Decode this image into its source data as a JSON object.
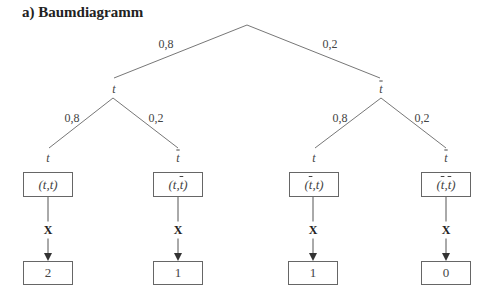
{
  "title": "a)  Baumdiagramm",
  "tree": {
    "level1": [
      {
        "label": "t",
        "bar": false,
        "prob": "0,8"
      },
      {
        "label": "t",
        "bar": true,
        "prob": "0,2"
      }
    ],
    "level2": [
      {
        "label": "t",
        "bar": false,
        "prob": "0,8"
      },
      {
        "label": "t",
        "bar": true,
        "prob": "0,2"
      },
      {
        "label": "t",
        "bar": false,
        "prob": "0,8"
      },
      {
        "label": "t",
        "bar": true,
        "prob": "0,2"
      }
    ]
  },
  "outcomes": [
    {
      "first": "t",
      "first_bar": false,
      "second": "t",
      "second_bar": false,
      "mapping": "X",
      "value": "2"
    },
    {
      "first": "t",
      "first_bar": false,
      "second": "t",
      "second_bar": true,
      "mapping": "X",
      "value": "1"
    },
    {
      "first": "t",
      "first_bar": true,
      "second": "t",
      "second_bar": false,
      "mapping": "X",
      "value": "1"
    },
    {
      "first": "t",
      "first_bar": true,
      "second": "t",
      "second_bar": true,
      "mapping": "X",
      "value": "0"
    }
  ],
  "colors": {
    "line": "#777777",
    "border": "#666666",
    "text": "#444444"
  }
}
